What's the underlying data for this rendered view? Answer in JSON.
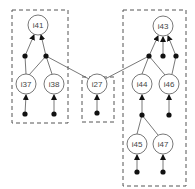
{
  "diagram": {
    "colors": {
      "stroke": "#555555",
      "dot": "#111111",
      "node_fill": "#ffffff",
      "background": "#ffffff"
    },
    "groups": [
      {
        "id": "left",
        "x": 12,
        "y": 10,
        "w": 56,
        "h": 113
      },
      {
        "id": "middle",
        "x": 82,
        "y": 77,
        "w": 32,
        "h": 45
      },
      {
        "id": "right",
        "x": 123,
        "y": 10,
        "w": 63,
        "h": 176
      }
    ],
    "nodes": [
      {
        "id": "i41",
        "label": "i41",
        "x": 38,
        "y": 25
      },
      {
        "id": "i37",
        "label": "i37",
        "x": 26,
        "y": 84
      },
      {
        "id": "i38",
        "label": "i38",
        "x": 54,
        "y": 84
      },
      {
        "id": "i27",
        "label": "i27",
        "x": 97,
        "y": 84
      },
      {
        "id": "i43",
        "label": "i43",
        "x": 163,
        "y": 26
      },
      {
        "id": "i44",
        "label": "i44",
        "x": 142,
        "y": 84
      },
      {
        "id": "i46",
        "label": "i46",
        "x": 169,
        "y": 84
      },
      {
        "id": "i45",
        "label": "i45",
        "x": 137,
        "y": 144
      },
      {
        "id": "i47",
        "label": "i47",
        "x": 163,
        "y": 144
      }
    ],
    "junctions": [
      {
        "id": "j41a",
        "x": 25,
        "y": 56
      },
      {
        "id": "j41b",
        "x": 46,
        "y": 56
      },
      {
        "id": "j37",
        "x": 25,
        "y": 114
      },
      {
        "id": "j38",
        "x": 54,
        "y": 114
      },
      {
        "id": "j27",
        "x": 97,
        "y": 113
      },
      {
        "id": "j43a",
        "x": 149,
        "y": 56
      },
      {
        "id": "j43b",
        "x": 163,
        "y": 56
      },
      {
        "id": "j43c",
        "x": 176,
        "y": 56
      },
      {
        "id": "j44",
        "x": 142,
        "y": 115
      },
      {
        "id": "j46",
        "x": 169,
        "y": 115
      },
      {
        "id": "j45",
        "x": 137,
        "y": 172
      },
      {
        "id": "j47",
        "x": 163,
        "y": 172
      }
    ]
  }
}
